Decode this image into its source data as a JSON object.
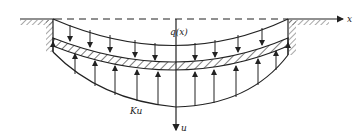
{
  "diagram": {
    "labels": {
      "x_axis": "x",
      "u_axis": "u",
      "load": "q(x)",
      "foundation_reaction": "Ku"
    },
    "colors": {
      "ink": "#222222",
      "background": "#ffffff"
    },
    "geometry": {
      "ground_y": 19,
      "left_wall_x": 53,
      "right_wall_x": 288,
      "center_x": 176,
      "load_curve_center_y": 45,
      "beam_top_center_y": 62,
      "beam_thickness": 8,
      "reaction_curve_center_y": 107,
      "down_arrow_xs": [
        70,
        90,
        110,
        135,
        160,
        195,
        215,
        238,
        262,
        280
      ],
      "up_arrow_xs": [
        53,
        75,
        95,
        115,
        137,
        160,
        192,
        214,
        236,
        258,
        278
      ]
    }
  }
}
